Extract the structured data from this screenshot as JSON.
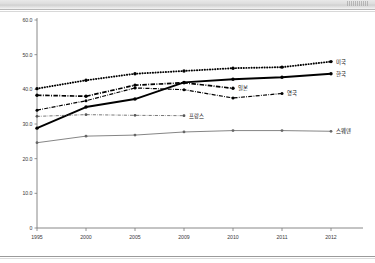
{
  "document": {
    "top_band_label": "",
    "footer_rule": true
  },
  "chart_data": {
    "type": "line",
    "title": "",
    "subtitle": "",
    "xlabel": "",
    "ylabel": "",
    "categories": [
      "1995",
      "2000",
      "2005",
      "2009",
      "2010",
      "2011",
      "2012"
    ],
    "ylim": [
      0,
      60
    ],
    "ytick_labels": [
      "60.0",
      "50.0",
      "40.0",
      "30.0",
      "20.0",
      "10.0",
      "0"
    ],
    "ytick_values": [
      60,
      50,
      40,
      30,
      20,
      10,
      0
    ],
    "grid": false,
    "legend_position": "end-of-line-annotation",
    "series": [
      {
        "name": "미국",
        "label": "미국",
        "style": "dotted-thick",
        "color": "#000000",
        "x": [
          "1995",
          "2000",
          "2005",
          "2009",
          "2010",
          "2011",
          "2012"
        ],
        "values": [
          40.2,
          42.6,
          44.5,
          45.3,
          46.1,
          46.4,
          48.0
        ]
      },
      {
        "name": "한국",
        "label": "한국",
        "style": "solid-thick",
        "color": "#000000",
        "x": [
          "1995",
          "2000",
          "2005",
          "2009",
          "2010",
          "2011",
          "2012"
        ],
        "values": [
          28.8,
          34.9,
          37.2,
          42.0,
          42.9,
          43.5,
          44.5
        ]
      },
      {
        "name": "일본",
        "label": "일본",
        "style": "dash-dot-thick",
        "color": "#000000",
        "x": [
          "1995",
          "2000",
          "2005",
          "2009",
          "2010"
        ],
        "values": [
          38.3,
          38.0,
          41.2,
          41.9,
          40.3
        ]
      },
      {
        "name": "영국",
        "label": "영국",
        "style": "dash-dot",
        "color": "#000000",
        "x": [
          "1995",
          "2000",
          "2005",
          "2009",
          "2010",
          "2011"
        ],
        "values": [
          34.0,
          36.7,
          40.4,
          39.9,
          37.5,
          38.8
        ]
      },
      {
        "name": "프랑스",
        "label": "프랑스",
        "style": "thin-dash-dot",
        "color": "#555555",
        "x": [
          "1995",
          "2000",
          "2005",
          "2009"
        ],
        "values": [
          32.2,
          32.7,
          32.5,
          32.4
        ]
      },
      {
        "name": "스웨덴",
        "label": "스웨덴",
        "style": "thin-solid",
        "color": "#666666",
        "x": [
          "1995",
          "2000",
          "2005",
          "2009",
          "2010",
          "2011",
          "2012"
        ],
        "values": [
          24.6,
          26.5,
          26.8,
          27.7,
          28.1,
          28.1,
          27.9
        ]
      }
    ]
  }
}
